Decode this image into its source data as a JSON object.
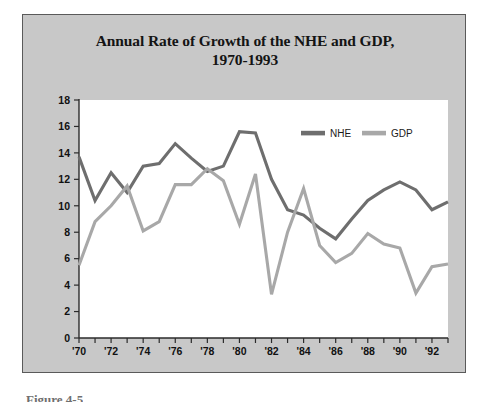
{
  "figure": {
    "caption": "Figure 4-5",
    "panel_background": "#c8c8c8",
    "plot_background": "#ffffff"
  },
  "legend": {
    "position": "top-right-inside",
    "entries": [
      {
        "label": "NHE",
        "color": "#6e6e6e"
      },
      {
        "label": "GDP",
        "color": "#a8a8a8"
      }
    ]
  },
  "chart_data": {
    "type": "line",
    "title": "Annual Rate of Growth of the NHE and GDP,",
    "title_line2": "1970-1993",
    "xlabel": "",
    "ylabel": "",
    "grid": false,
    "xlim": [
      1970,
      1993
    ],
    "ylim": [
      0,
      18
    ],
    "yticks": [
      0,
      2,
      4,
      6,
      8,
      10,
      12,
      14,
      16,
      18
    ],
    "ytick_labels": [
      "0",
      "2",
      "4",
      "6",
      "8",
      "10",
      "12",
      "14",
      "16",
      "18"
    ],
    "x": [
      1970,
      1971,
      1972,
      1973,
      1974,
      1975,
      1976,
      1977,
      1978,
      1979,
      1980,
      1981,
      1982,
      1983,
      1984,
      1985,
      1986,
      1987,
      1988,
      1989,
      1990,
      1991,
      1992,
      1993
    ],
    "xticks": [
      1970,
      1971,
      1972,
      1973,
      1974,
      1975,
      1976,
      1977,
      1978,
      1979,
      1980,
      1981,
      1982,
      1983,
      1984,
      1985,
      1986,
      1987,
      1988,
      1989,
      1990,
      1991,
      1992,
      1993
    ],
    "xtick_labels": [
      "'70",
      "",
      "'72",
      "",
      "'74",
      "",
      "'76",
      "",
      "'78",
      "",
      "'80",
      "",
      "'82",
      "",
      "'84",
      "",
      "'86",
      "",
      "'88",
      "",
      "'90",
      "",
      "'92",
      ""
    ],
    "series": [
      {
        "name": "NHE",
        "color": "#6e6e6e",
        "values": [
          13.7,
          10.4,
          12.5,
          11.0,
          13.0,
          13.2,
          14.7,
          13.6,
          12.6,
          13.0,
          15.6,
          15.5,
          12.0,
          9.7,
          9.3,
          8.3,
          7.5,
          9.0,
          10.4,
          11.2,
          11.8,
          11.2,
          9.7,
          10.3
        ]
      },
      {
        "name": "GDP",
        "color": "#a8a8a8",
        "values": [
          5.5,
          8.8,
          10.0,
          11.5,
          8.1,
          8.8,
          11.6,
          11.6,
          12.8,
          11.9,
          8.6,
          12.4,
          3.3,
          8.0,
          11.3,
          7.0,
          5.7,
          6.4,
          7.9,
          7.1,
          6.8,
          3.4,
          5.4,
          5.6
        ]
      }
    ]
  }
}
